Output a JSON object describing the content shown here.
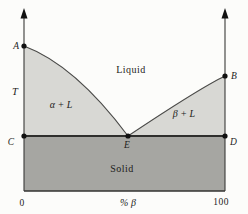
{
  "figure": {
    "type": "phase-diagram",
    "regions": {
      "liquid": "Liquid",
      "alpha_plus_liquid": "α + L",
      "beta_plus_liquid": "β + L",
      "solid": "Solid"
    },
    "points": {
      "a": "A",
      "b": "B",
      "c": "C",
      "d": "D",
      "e": "E"
    },
    "axes": {
      "y_label": "T",
      "x_label": "% β",
      "x_tick_min": "0",
      "x_tick_max": "100"
    },
    "colors": {
      "background": "#fcfcfa",
      "two_phase_fill": "#d8d8d4",
      "solid_fill": "#a6a6a2",
      "line": "#3a3a38",
      "point": "#111111"
    }
  }
}
